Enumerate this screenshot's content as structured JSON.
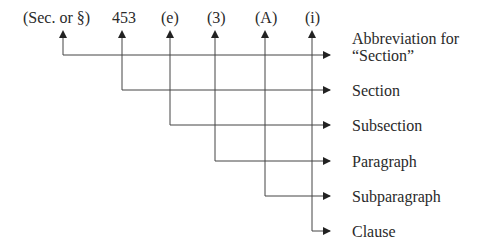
{
  "citation_parts": [
    {
      "token": "(Sec. or  §)",
      "label": "Abbreviation for\n“Section”"
    },
    {
      "token": "453",
      "label": "Section"
    },
    {
      "token": "(e)",
      "label": "Subsection"
    },
    {
      "token": "(3)",
      "label": "Paragraph"
    },
    {
      "token": "(A)",
      "label": "Subparagraph"
    },
    {
      "token": "(i)",
      "label": "Clause"
    }
  ],
  "tokens": {
    "t0": "(Sec. or  §)",
    "t1": "453",
    "t2": "(e)",
    "t3": "(3)",
    "t4": "(A)",
    "t5": "(i)"
  },
  "labels": {
    "l0a": "Abbreviation for",
    "l0b": "“Section”",
    "l1": "Section",
    "l2": "Subsection",
    "l3": "Paragraph",
    "l4": "Subparagraph",
    "l5": "Clause"
  }
}
